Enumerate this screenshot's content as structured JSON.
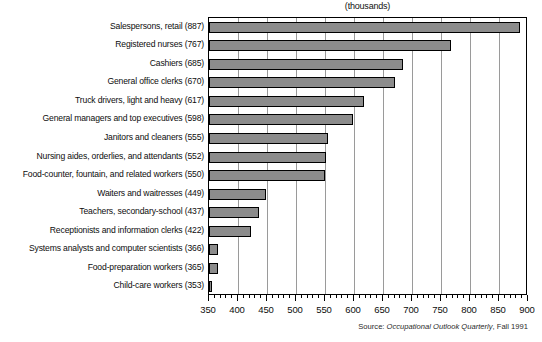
{
  "chart_data": {
    "type": "bar",
    "orientation": "horizontal",
    "title": "(thousands)",
    "xlabel": "",
    "ylabel": "",
    "xlim": [
      350,
      900
    ],
    "xticks": [
      350,
      400,
      450,
      500,
      550,
      600,
      650,
      700,
      750,
      800,
      850,
      900
    ],
    "xtick_labels": [
      "350",
      "400",
      "450",
      "500",
      "550",
      "600",
      "650",
      "700",
      "750",
      "800",
      "850",
      "900"
    ],
    "minor_tick_step": 10,
    "grid": true,
    "grid_axis": "x",
    "legend": null,
    "categories": [
      "Salespersons, retail (887)",
      "Registered nurses (767)",
      "Cashiers (685)",
      "General office clerks (670)",
      "Truck drivers, light and heavy (617)",
      "General managers and top executives (598)",
      "Janitors and cleaners (555)",
      "Nursing aides, orderlies, and attendants (552)",
      "Food-counter, fountain, and related workers (550)",
      "Waiters and waitresses (449)",
      "Teachers, secondary-school (437)",
      "Receptionists and information clerks (422)",
      "Systems analysts and computer scientists (366)",
      "Food-preparation workers (365)",
      "Child-care workers (353)"
    ],
    "occupations": [
      "Salespersons, retail",
      "Registered nurses",
      "Cashiers",
      "General office clerks",
      "Truck drivers, light and heavy",
      "General managers and top executives",
      "Janitors and cleaners",
      "Nursing aides, orderlies, and attendants",
      "Food-counter, fountain, and related workers",
      "Waiters and waitresses",
      "Teachers, secondary-school",
      "Receptionists and information clerks",
      "Systems analysts and computer scientists",
      "Food-preparation workers",
      "Child-care workers"
    ],
    "values": [
      887,
      767,
      685,
      670,
      617,
      598,
      555,
      552,
      550,
      449,
      437,
      422,
      366,
      365,
      353
    ],
    "bar_fill_color": "#8c8c8c",
    "bar_border_color": "#000000",
    "gridline_color": "#9a9a9a",
    "plot_border_color": "#000000",
    "background_color": "#ffffff"
  },
  "source": {
    "prefix": "Source: ",
    "publication": "Occupational Outlook Quarterly",
    "suffix": ", Fall 1991",
    "full": "Source: Occupational Outlook Quarterly, Fall 1991"
  }
}
